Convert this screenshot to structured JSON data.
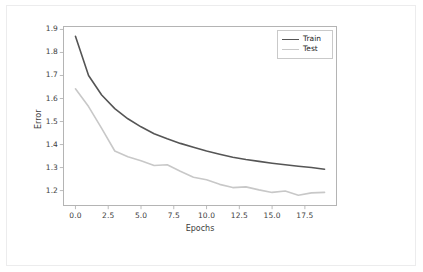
{
  "figure": {
    "background_color": "#ffffff",
    "border_color": "#ececed",
    "axes_color": "#b4b4b4",
    "text_color": "#3d3d3d"
  },
  "axis": {
    "ylabel": "Error",
    "xlabel": "Epochs",
    "yticks": [
      "1.9",
      "1.8",
      "1.7",
      "1.6",
      "1.5",
      "1.4",
      "1.3",
      "1.2"
    ],
    "xticks": [
      "0.0",
      "2.5",
      "5.0",
      "7.5",
      "10.0",
      "12.5",
      "15.0",
      "17.5"
    ]
  },
  "legend": {
    "items": [
      {
        "label": "Train",
        "color": "#555555"
      },
      {
        "label": "Test",
        "color": "#c8c8c8"
      }
    ]
  },
  "chart_data": {
    "type": "line",
    "title": "",
    "xlabel": "Epochs",
    "ylabel": "Error",
    "xlim": [
      -0.95,
      19.95
    ],
    "ylim": [
      1.133,
      1.915
    ],
    "xticks": [
      0.0,
      2.5,
      5.0,
      7.5,
      10.0,
      12.5,
      15.0,
      17.5
    ],
    "yticks": [
      1.2,
      1.3,
      1.4,
      1.5,
      1.6,
      1.7,
      1.8,
      1.9
    ],
    "grid": false,
    "legend_position": "upper right",
    "x": [
      0,
      1,
      2,
      3,
      4,
      5,
      6,
      7,
      8,
      9,
      10,
      11,
      12,
      13,
      14,
      15,
      16,
      17,
      18,
      19
    ],
    "series": [
      {
        "name": "Train",
        "color": "#555555",
        "linewidth": 1.6,
        "values": [
          1.87,
          1.7,
          1.615,
          1.556,
          1.512,
          1.477,
          1.447,
          1.425,
          1.405,
          1.388,
          1.372,
          1.358,
          1.345,
          1.335,
          1.327,
          1.319,
          1.312,
          1.306,
          1.3,
          1.293
        ]
      },
      {
        "name": "Test",
        "color": "#c8c8c8",
        "linewidth": 1.6,
        "values": [
          1.642,
          1.565,
          1.47,
          1.372,
          1.347,
          1.33,
          1.309,
          1.312,
          1.284,
          1.258,
          1.247,
          1.227,
          1.213,
          1.216,
          1.203,
          1.192,
          1.198,
          1.18,
          1.19,
          1.192
        ]
      }
    ]
  }
}
